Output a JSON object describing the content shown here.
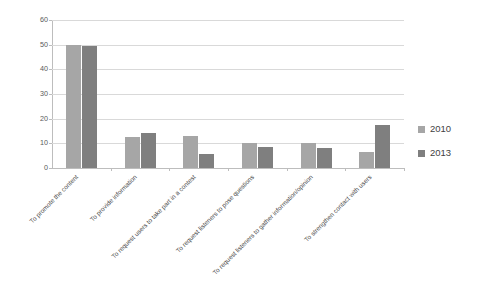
{
  "chart_data": {
    "type": "bar",
    "title": "",
    "subtitle": "",
    "xlabel": "",
    "ylabel": "",
    "ylim": [
      0,
      60
    ],
    "yticks": [
      0,
      10,
      20,
      30,
      40,
      50,
      60
    ],
    "ytick_labels": [
      "0",
      "10",
      "20",
      "30",
      "40",
      "50",
      "60"
    ],
    "grid": true,
    "legend_position": "right",
    "categories": [
      "To promote the content",
      "To provide information",
      "To request users to take part in a contest",
      "To request listeners to pose questions",
      "To request listeners to gather information/opinion",
      "To strengthen contact with users"
    ],
    "series": [
      {
        "name": "2010",
        "color": "#a6a6a6",
        "values": [
          50,
          12.5,
          13,
          10,
          10,
          6.5
        ]
      },
      {
        "name": "2013",
        "color": "#7f7f7f",
        "values": [
          49.5,
          14,
          5.5,
          8.5,
          8,
          17.5
        ]
      }
    ]
  },
  "legend": {
    "items": [
      {
        "label": "2010",
        "color": "#a6a6a6"
      },
      {
        "label": "2013",
        "color": "#7f7f7f"
      }
    ]
  }
}
